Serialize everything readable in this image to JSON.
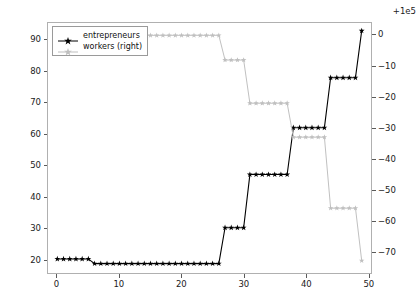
{
  "chart_data": {
    "type": "line",
    "title": "",
    "xlabel": "",
    "ylabel": "",
    "grid": false,
    "legend_position": "upper left",
    "xlim": [
      -1.5,
      50.5
    ],
    "xticks": [
      0,
      10,
      20,
      30,
      40,
      50
    ],
    "xtick_labels": [
      "0",
      "10",
      "20",
      "30",
      "40",
      "50"
    ],
    "left_axis": {
      "label": "",
      "ylim": [
        15.5,
        95.5
      ],
      "yticks": [
        20,
        30,
        40,
        50,
        60,
        70,
        80,
        90
      ],
      "ytick_labels": [
        "20",
        "30",
        "40",
        "50",
        "60",
        "70",
        "80",
        "90"
      ]
    },
    "right_axis": {
      "label": "",
      "offset_text": "+1e5",
      "ylim": [
        -77,
        4
      ],
      "yticks": [
        0,
        -10,
        -20,
        -30,
        -40,
        -50,
        -60,
        -70
      ],
      "ytick_labels": [
        "0",
        "−10",
        "−20",
        "−30",
        "−40",
        "−50",
        "−60",
        "−70"
      ]
    },
    "series": [
      {
        "name": "entrepreneurs",
        "legend_label": "entrepreneurs",
        "axis": "left",
        "color": "#000000",
        "marker": "star",
        "x": [
          0,
          1,
          2,
          3,
          4,
          5,
          6,
          7,
          8,
          9,
          10,
          11,
          12,
          13,
          14,
          15,
          16,
          17,
          18,
          19,
          20,
          21,
          22,
          23,
          24,
          25,
          26,
          27,
          28,
          29,
          30,
          31,
          32,
          33,
          34,
          35,
          36,
          37,
          38,
          39,
          40,
          41,
          42,
          43,
          44,
          45,
          46,
          47,
          48,
          49
        ],
        "values": [
          20,
          20,
          20,
          20,
          20,
          20,
          18.5,
          18.5,
          18.5,
          18.5,
          18.5,
          18.5,
          18.5,
          18.5,
          18.5,
          18.5,
          18.5,
          18.5,
          18.5,
          18.5,
          18.5,
          18.5,
          18.5,
          18.5,
          18.5,
          18.5,
          18.5,
          30,
          30,
          30,
          30,
          47,
          47,
          47,
          47,
          47,
          47,
          47,
          62,
          62,
          62,
          62,
          62,
          62,
          78,
          78,
          78,
          78,
          78,
          93
        ]
      },
      {
        "name": "workers",
        "legend_label": "workers (right)",
        "axis": "right",
        "color": "#bfbfbf",
        "marker": "star",
        "x": [
          6,
          7,
          8,
          9,
          10,
          11,
          12,
          13,
          14,
          15,
          16,
          17,
          18,
          19,
          20,
          21,
          22,
          23,
          24,
          25,
          26,
          27,
          28,
          29,
          30,
          31,
          32,
          33,
          34,
          35,
          36,
          37,
          38,
          39,
          40,
          41,
          42,
          43,
          44,
          45,
          46,
          47,
          48,
          49
        ],
        "values": [
          0,
          0,
          0,
          0,
          0,
          0,
          0,
          0,
          0,
          0,
          0,
          0,
          0,
          0,
          0,
          0,
          0,
          0,
          0,
          0,
          0,
          -8,
          -8,
          -8,
          -8,
          -22,
          -22,
          -22,
          -22,
          -22,
          -22,
          -22,
          -33,
          -33,
          -33,
          -33,
          -33,
          -33,
          -56,
          -56,
          -56,
          -56,
          -56,
          -73
        ]
      }
    ]
  }
}
